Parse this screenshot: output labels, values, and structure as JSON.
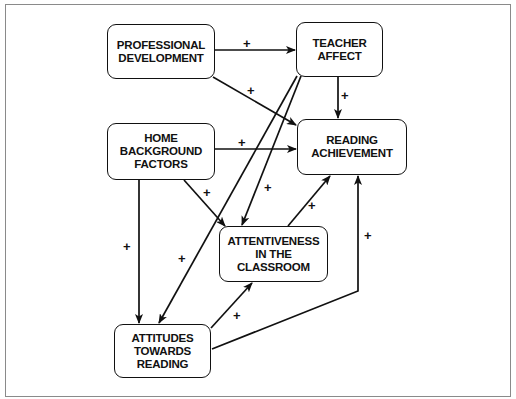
{
  "diagram": {
    "nodes": [
      {
        "id": "professional_development",
        "label": "PROFESSIONAL\nDEVELOPMENT"
      },
      {
        "id": "teacher_affect",
        "label": "TEACHER\nAFFECT"
      },
      {
        "id": "home_background",
        "label": "HOME\nBACKGROUND\nFACTORS"
      },
      {
        "id": "reading_achievement",
        "label": "READING\nACHIEVEMENT"
      },
      {
        "id": "attentiveness",
        "label": "ATTENTIVENESS\nIN THE\nCLASSROOM"
      },
      {
        "id": "attitudes",
        "label": "ATTITUDES\nTOWARDS\nREADING"
      }
    ],
    "edges": [
      {
        "from": "professional_development",
        "to": "teacher_affect",
        "sign": "+"
      },
      {
        "from": "professional_development",
        "to": "reading_achievement",
        "sign": "+"
      },
      {
        "from": "teacher_affect",
        "to": "reading_achievement",
        "sign": "+"
      },
      {
        "from": "teacher_affect",
        "to": "attentiveness",
        "sign": "+"
      },
      {
        "from": "teacher_affect",
        "to": "attitudes",
        "sign": "+"
      },
      {
        "from": "home_background",
        "to": "reading_achievement",
        "sign": "+"
      },
      {
        "from": "home_background",
        "to": "attentiveness",
        "sign": "+"
      },
      {
        "from": "home_background",
        "to": "attitudes",
        "sign": "+"
      },
      {
        "from": "attentiveness",
        "to": "reading_achievement",
        "sign": "+"
      },
      {
        "from": "attitudes",
        "to": "attentiveness",
        "sign": "+"
      },
      {
        "from": "attitudes",
        "to": "reading_achievement",
        "sign": "+"
      }
    ]
  }
}
